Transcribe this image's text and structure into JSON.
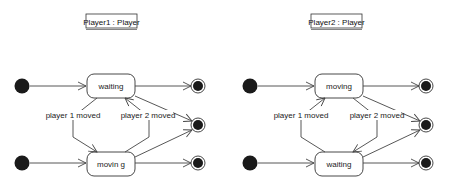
{
  "diagrams": [
    {
      "title": "Player1 : Player",
      "top_state": "waiting",
      "bottom_state": "movin g",
      "left_transition": "player 1 moved",
      "right_transition": "player 2 moved",
      "left_arrow_direction": "down",
      "right_arrow_direction": "up"
    },
    {
      "title": "Player2 : Player",
      "top_state": "moving",
      "bottom_state": "waiting",
      "left_transition": "player 1 moved",
      "right_transition": "player 2 moved",
      "left_arrow_direction": "up",
      "right_arrow_direction": "down"
    }
  ]
}
